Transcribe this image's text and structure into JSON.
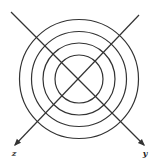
{
  "diagram": {
    "type": "concentric-circles-with-axes",
    "stroke_color": "#333333",
    "background": "#ffffff",
    "center": {
      "x": 79,
      "y": 79
    },
    "circles": [
      {
        "r": 24
      },
      {
        "r": 36
      },
      {
        "r": 47.5
      },
      {
        "r": 59.5
      }
    ],
    "axes": [
      {
        "name": "z",
        "label": "z",
        "from": {
          "x": 139,
          "y": 15
        },
        "to": {
          "x": 15,
          "y": 145
        },
        "label_pos": {
          "x": 14,
          "y": 156
        }
      },
      {
        "name": "y",
        "label": "y",
        "from": {
          "x": 11,
          "y": 12
        },
        "to": {
          "x": 144,
          "y": 145
        },
        "label_pos": {
          "x": 145,
          "y": 156
        }
      }
    ]
  }
}
